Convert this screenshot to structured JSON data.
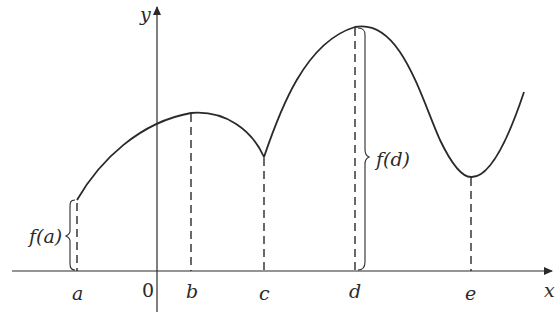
{
  "figure": {
    "axes": {
      "x_label": "x",
      "y_label": "y",
      "origin_label": "0"
    },
    "points": [
      {
        "id": "a",
        "label": "a"
      },
      {
        "id": "b",
        "label": "b"
      },
      {
        "id": "c",
        "label": "c"
      },
      {
        "id": "d",
        "label": "d"
      },
      {
        "id": "e",
        "label": "e"
      }
    ],
    "annotations": {
      "fa": "f(a)",
      "fd": "f(d)"
    },
    "colors": {
      "stroke": "#2a2a2a",
      "background": "#ffffff"
    }
  }
}
